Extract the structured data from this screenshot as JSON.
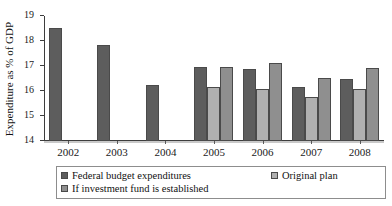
{
  "chart_data": {
    "type": "bar",
    "title": "",
    "xlabel": "",
    "ylabel": "Expenditure as % of GDP",
    "ylim": [
      14,
      19
    ],
    "yticks": [
      14,
      15,
      16,
      17,
      18,
      19
    ],
    "grid": false,
    "legend_position": "bottom",
    "categories": [
      "2002",
      "2003",
      "2004",
      "2005",
      "2006",
      "2007",
      "2008"
    ],
    "series": [
      {
        "name": "Federal budget expenditures",
        "color": "#5d5d5d",
        "values": [
          18.52,
          17.85,
          16.25,
          16.95,
          16.88,
          16.18,
          16.48
        ]
      },
      {
        "name": "Original plan",
        "color": "#b0b0b0",
        "values": [
          null,
          null,
          null,
          16.15,
          16.08,
          15.78,
          16.1
        ]
      },
      {
        "name": "If investment fund is established",
        "color": "#8f8f8f",
        "values": [
          null,
          null,
          null,
          16.95,
          17.13,
          16.52,
          16.92
        ]
      }
    ]
  },
  "legend": {
    "items": [
      {
        "label": "Federal budget expenditures",
        "swatch": "s0"
      },
      {
        "label": "Original plan",
        "swatch": "s1"
      },
      {
        "label": "If investment fund is established",
        "swatch": "s2"
      }
    ]
  },
  "artifact": {
    "top_strip": ""
  }
}
